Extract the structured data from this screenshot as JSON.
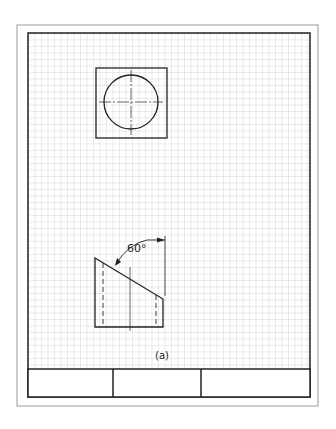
{
  "sheet": {
    "outer_border": {
      "x": 17,
      "y": 25,
      "w": 301,
      "h": 381
    },
    "inner_border": {
      "x": 28,
      "y": 33,
      "w": 282,
      "h": 364
    },
    "grid": {
      "x": 28,
      "y": 33,
      "w": 282,
      "h": 336,
      "spacing": 6.5,
      "color": "#b8b8b8"
    },
    "title_block": {
      "y": 369,
      "h": 28,
      "dividers": [
        113,
        201
      ]
    }
  },
  "top_view": {
    "square": {
      "x": 96,
      "y": 68,
      "w": 71,
      "h": 70
    },
    "circle": {
      "cx": 131,
      "cy": 102,
      "r": 27
    }
  },
  "front_view": {
    "angle_label": "60°",
    "caption": "(a)"
  }
}
